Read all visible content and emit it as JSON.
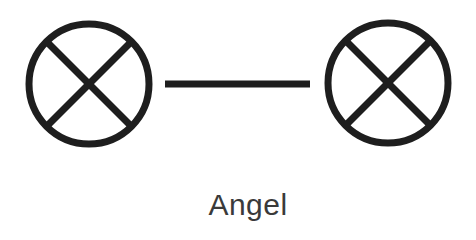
{
  "diagram": {
    "label": "Angel",
    "stroke_color": "#1e1e1e",
    "symbols": [
      {
        "name": "left-crossed-circle",
        "cx": 89,
        "cy": 84,
        "r": 60
      },
      {
        "name": "right-crossed-circle",
        "cx": 388,
        "cy": 83,
        "r": 60
      }
    ],
    "connector": {
      "x1": 165,
      "y1": 84,
      "x2": 310,
      "y2": 84
    }
  }
}
